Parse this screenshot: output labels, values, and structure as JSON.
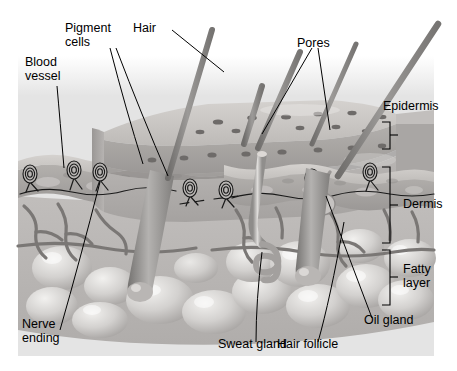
{
  "figure": {
    "kind": "anatomical-cross-section-illustration",
    "background_color": "#e4e4e4",
    "page_color": "#ffffff",
    "ink_color": "#000000"
  },
  "labels": {
    "blood_vessel": "Blood\nvessel",
    "pigment_cells": "Pigment\ncells",
    "hair": "Hair",
    "pores": "Pores",
    "epidermis": "Epidermis",
    "dermis": "Dermis",
    "fatty_layer": "Fatty\nlayer",
    "oil_gland": "Oil gland",
    "hair_follicle": "Hair follicle",
    "sweat_gland": "Sweat gland",
    "nerve_ending": "Nerve\nending"
  },
  "layer_brackets": [
    {
      "name": "Epidermis",
      "top": 122,
      "bottom": 149
    },
    {
      "name": "Dermis",
      "top": 167,
      "bottom": 243
    },
    {
      "name": "Fatty layer",
      "top": 250,
      "bottom": 305
    }
  ],
  "structures": [
    "hair shaft",
    "hair follicle",
    "pore",
    "pigment cell",
    "epidermis layer",
    "dermis layer",
    "fatty layer",
    "blood vessel",
    "nerve ending",
    "sweat gland",
    "oil gland"
  ],
  "palette": {
    "epidermis_top": "#c9c6c3",
    "epidermis_mid": "#a9a6a4",
    "dermis": "#b5b2b0",
    "fat_globule": "#cfcdcb",
    "hair": "#8e8c8a",
    "vessel": "#7d7a78"
  }
}
